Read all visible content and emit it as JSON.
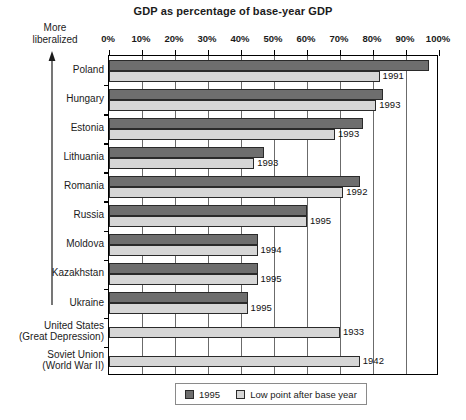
{
  "chart_data": {
    "type": "bar",
    "orientation": "horizontal",
    "title": "GDP as percentage of base-year GDP",
    "xlabel": "",
    "ylabel": "",
    "xlim": [
      0,
      100
    ],
    "xtick_labels": [
      "0%",
      "10%",
      "20%",
      "30%",
      "40%",
      "50%",
      "60%",
      "70%",
      "80%",
      "90%",
      "100%"
    ],
    "xticks": [
      0,
      10,
      20,
      30,
      40,
      50,
      60,
      70,
      80,
      90,
      100
    ],
    "grid": true,
    "legend_position": "bottom-center",
    "categories": [
      "Poland",
      "Hungary",
      "Estonia",
      "Lithuania",
      "Romania",
      "Russia",
      "Moldova",
      "Kazakhstan",
      "Ukraine",
      "United States\n(Great Depression)",
      "Soviet Union\n(World War II)"
    ],
    "series": [
      {
        "name": "1995",
        "color": "#6e6e6e",
        "values": [
          97,
          83,
          77,
          47,
          76,
          60,
          45,
          45,
          42,
          null,
          null
        ]
      },
      {
        "name": "Low point after base year",
        "color": "#d6d6d6",
        "values": [
          82,
          81,
          68.5,
          44,
          71,
          60,
          45,
          45,
          42,
          70,
          76
        ]
      }
    ],
    "annotations": {
      "low_point_years": [
        "1991",
        "1993",
        "1993",
        "1993",
        "1992",
        "1995",
        "1994",
        "1995",
        "1995",
        "1933",
        "1942"
      ],
      "axis_note": "More\nliberalized",
      "axis_note_direction": "up"
    }
  },
  "rows": [
    {
      "label": "Poland",
      "label_lines": [
        "Poland"
      ],
      "v1995": 97,
      "vlow": 82,
      "year": "1991"
    },
    {
      "label": "Hungary",
      "label_lines": [
        "Hungary"
      ],
      "v1995": 83,
      "vlow": 81,
      "year": "1993"
    },
    {
      "label": "Estonia",
      "label_lines": [
        "Estonia"
      ],
      "v1995": 77,
      "vlow": 68.5,
      "year": "1993"
    },
    {
      "label": "Lithuania",
      "label_lines": [
        "Lithuania"
      ],
      "v1995": 47,
      "vlow": 44,
      "year": "1993"
    },
    {
      "label": "Romania",
      "label_lines": [
        "Romania"
      ],
      "v1995": 76,
      "vlow": 71,
      "year": "1992"
    },
    {
      "label": "Russia",
      "label_lines": [
        "Russia"
      ],
      "v1995": 60,
      "vlow": 60,
      "year": "1995"
    },
    {
      "label": "Moldova",
      "label_lines": [
        "Moldova"
      ],
      "v1995": 45,
      "vlow": 45,
      "year": "1994"
    },
    {
      "label": "Kazakhstan",
      "label_lines": [
        "Kazakhstan"
      ],
      "v1995": 45,
      "vlow": 45,
      "year": "1995"
    },
    {
      "label": "Ukraine",
      "label_lines": [
        "Ukraine"
      ],
      "v1995": 42,
      "vlow": 42,
      "year": "1995"
    },
    {
      "label": "United States (Great Depression)",
      "label_lines": [
        "United States",
        "(Great Depression)"
      ],
      "v1995": null,
      "vlow": 70,
      "year": "1933"
    },
    {
      "label": "Soviet Union (World War II)",
      "label_lines": [
        "Soviet Union",
        "(World War II)"
      ],
      "v1995": null,
      "vlow": 76,
      "year": "1942"
    }
  ],
  "axis": {
    "note_line1": "More",
    "note_line2": "liberalized"
  },
  "legend": {
    "items": [
      {
        "label": "1995",
        "swatch": "dark"
      },
      {
        "label": "Low point after base year",
        "swatch": "light"
      }
    ]
  },
  "colors": {
    "series_1995": "#6e6e6e",
    "series_low": "#d6d6d6",
    "outline": "#2a2a2a",
    "grid": "#6b6b6b"
  }
}
